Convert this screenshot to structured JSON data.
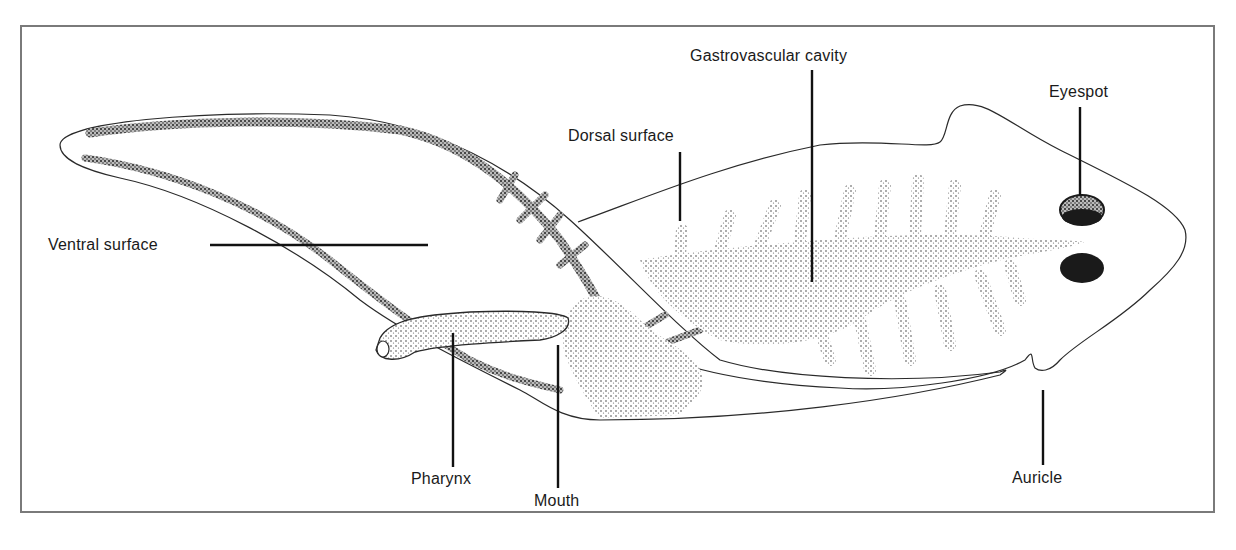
{
  "figure": {
    "labels": {
      "gastrovascular_cavity": "Gastrovascular cavity",
      "eyespot": "Eyespot",
      "dorsal_surface": "Dorsal surface",
      "ventral_surface": "Ventral surface",
      "pharynx": "Pharynx",
      "mouth": "Mouth",
      "auricle": "Auricle"
    },
    "colors": {
      "frame": "#7a7a7a",
      "outline": "#2a2a2a",
      "stipple": "#555555",
      "eyespot": "#1a1a1a"
    }
  }
}
